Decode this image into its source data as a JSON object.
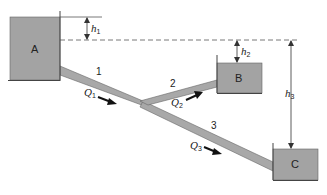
{
  "diagram": {
    "type": "three-reservoir pipe network",
    "colors": {
      "tank_fill": "#a3a3a3",
      "pipe_fill": "#a8a8a8",
      "line": "#444444",
      "arrow": "#111111"
    },
    "tanks": [
      {
        "id": "A",
        "label": "A"
      },
      {
        "id": "B",
        "label": "B"
      },
      {
        "id": "C",
        "label": "C"
      }
    ],
    "pipes": [
      {
        "id": "1",
        "label": "1"
      },
      {
        "id": "2",
        "label": "2"
      },
      {
        "id": "3",
        "label": "3"
      }
    ],
    "flows": [
      {
        "symbol": "Q",
        "sub": "1"
      },
      {
        "symbol": "Q",
        "sub": "2"
      },
      {
        "symbol": "Q",
        "sub": "3"
      }
    ],
    "heights": [
      {
        "symbol": "h",
        "sub": "1"
      },
      {
        "symbol": "h",
        "sub": "2"
      },
      {
        "symbol": "h",
        "sub": "3"
      }
    ]
  }
}
